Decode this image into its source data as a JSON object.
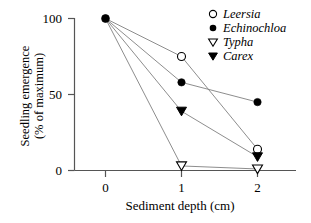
{
  "chart_data": {
    "type": "line",
    "title": "",
    "xlabel": "Sediment depth (cm)",
    "ylabel": "Seedling emergence\n(% of maximum)",
    "ylabel_line1": "Seedling emergence",
    "ylabel_line2": "(% of maximum)",
    "x": [
      0,
      1,
      2
    ],
    "xlim": [
      -0.25,
      2.5
    ],
    "ylim": [
      0,
      100
    ],
    "xticks": [
      "0",
      "1",
      "2"
    ],
    "yticks": [
      "0",
      "50",
      "100"
    ],
    "xtick_values": [
      0,
      1,
      2
    ],
    "ytick_values": [
      0,
      50,
      100
    ],
    "grid": false,
    "legend_position": "top-right",
    "line_color": "#808080",
    "marker_color": "#000000",
    "series": [
      {
        "name": "Leersia",
        "marker": "open-circle",
        "values": [
          100,
          75,
          14
        ]
      },
      {
        "name": "Echinochloa",
        "marker": "filled-circle",
        "values": [
          100,
          58,
          45
        ]
      },
      {
        "name": "Typha",
        "marker": "open-triangle-down",
        "values": [
          100,
          3,
          1
        ]
      },
      {
        "name": "Carex",
        "marker": "filled-triangle-down",
        "values": [
          100,
          39,
          9
        ]
      }
    ]
  },
  "legend": {
    "items": [
      {
        "label": "Leersia",
        "marker": "open-circle-icon"
      },
      {
        "label": "Echinochloa",
        "marker": "filled-circle-icon"
      },
      {
        "label": "Typha",
        "marker": "open-triangle-down-icon"
      },
      {
        "label": "Carex",
        "marker": "filled-triangle-down-icon"
      }
    ]
  },
  "axes": {
    "y_tick_0": "0",
    "y_tick_50": "50",
    "y_tick_100": "100",
    "x_tick_0": "0",
    "x_tick_1": "1",
    "x_tick_2": "2"
  }
}
